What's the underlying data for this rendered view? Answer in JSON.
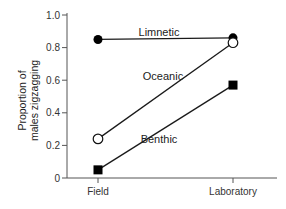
{
  "chart_data": {
    "type": "line",
    "title": "",
    "xlabel": "",
    "ylabel": "Proportion of males zigzagging",
    "ylabel_lines": [
      "Proportion of",
      "males zigzagging"
    ],
    "categories": [
      "Field",
      "Laboratory"
    ],
    "ylim": [
      0,
      1.0
    ],
    "yticks": [
      0,
      0.2,
      0.4,
      0.6,
      0.8,
      1.0
    ],
    "ytick_labels": [
      "0",
      "0.2",
      "0.4",
      "0.6",
      "0.8",
      "1.0"
    ],
    "grid": false,
    "legend": "inline labels",
    "series": [
      {
        "name": "Limnetic",
        "marker": "filled-circle",
        "values": [
          0.85,
          0.86
        ]
      },
      {
        "name": "Oceanic",
        "marker": "open-circle",
        "values": [
          0.24,
          0.83
        ]
      },
      {
        "name": "Benthic",
        "marker": "filled-square",
        "values": [
          0.05,
          0.57
        ]
      }
    ]
  },
  "colors": {
    "line": "#1a1a1a",
    "axis": "#555555",
    "text": "#222222"
  }
}
